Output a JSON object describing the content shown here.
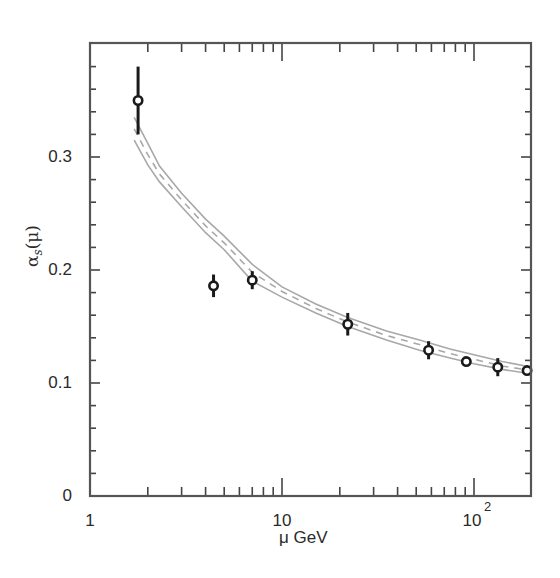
{
  "chart_data": {
    "type": "scatter",
    "title": "",
    "xlabel": "μ GeV",
    "ylabel": "αs(μ)",
    "ylabel_parts": {
      "symbol": "α",
      "subscript": "s",
      "arg": "(μ)"
    },
    "xscale": "log",
    "xlim": [
      1,
      200
    ],
    "ylim": [
      0,
      0.4
    ],
    "grid": false,
    "legend": null,
    "x_ticks": [
      {
        "value": 1,
        "label": "1"
      },
      {
        "value": 10,
        "label": "10"
      },
      {
        "value": 100,
        "label": "10",
        "superscript": "2"
      }
    ],
    "y_ticks": [
      {
        "value": 0,
        "label": "0"
      },
      {
        "value": 0.1,
        "label": "0.1"
      },
      {
        "value": 0.2,
        "label": "0.2"
      },
      {
        "value": 0.3,
        "label": "0.3"
      }
    ],
    "y_minor_step": 0.02,
    "series": [
      {
        "name": "measurements",
        "kind": "errorbar",
        "marker": "open-circle",
        "color": "#1a1a1a",
        "points": [
          {
            "x": 1.78,
            "y": 0.35,
            "err_lo": 0.03,
            "err_hi": 0.03
          },
          {
            "x": 4.4,
            "y": 0.186,
            "err_lo": 0.01,
            "err_hi": 0.01
          },
          {
            "x": 7.0,
            "y": 0.191,
            "err_lo": 0.008,
            "err_hi": 0.008
          },
          {
            "x": 22,
            "y": 0.152,
            "err_lo": 0.01,
            "err_hi": 0.01
          },
          {
            "x": 58,
            "y": 0.129,
            "err_lo": 0.008,
            "err_hi": 0.008
          },
          {
            "x": 91.2,
            "y": 0.119,
            "err_lo": 0.003,
            "err_hi": 0.003
          },
          {
            "x": 133,
            "y": 0.114,
            "err_lo": 0.008,
            "err_hi": 0.008
          },
          {
            "x": 189,
            "y": 0.111,
            "err_lo": 0.004,
            "err_hi": 0.004
          }
        ]
      },
      {
        "name": "QCD prediction (upper band)",
        "kind": "line",
        "style": "solid",
        "color": "#a8a8a8",
        "x": [
          1.7,
          2.0,
          2.3,
          3.0,
          4.0,
          5.0,
          7.0,
          10,
          15,
          22,
          35,
          52,
          75,
          100,
          140,
          200
        ],
        "y": [
          0.335,
          0.312,
          0.292,
          0.268,
          0.245,
          0.23,
          0.205,
          0.185,
          0.17,
          0.158,
          0.146,
          0.138,
          0.13,
          0.125,
          0.119,
          0.114
        ]
      },
      {
        "name": "QCD prediction (central)",
        "kind": "line",
        "style": "dashed",
        "color": "#a8a8a8",
        "x": [
          1.7,
          2.0,
          2.3,
          3.0,
          4.0,
          5.0,
          7.0,
          10,
          15,
          22,
          35,
          52,
          75,
          100,
          140,
          200
        ],
        "y": [
          0.325,
          0.302,
          0.285,
          0.262,
          0.239,
          0.224,
          0.198,
          0.181,
          0.166,
          0.154,
          0.142,
          0.134,
          0.126,
          0.121,
          0.115,
          0.111
        ]
      },
      {
        "name": "QCD prediction (lower band)",
        "kind": "line",
        "style": "solid",
        "color": "#a8a8a8",
        "x": [
          1.7,
          2.0,
          2.3,
          3.0,
          4.0,
          5.0,
          7.0,
          10,
          15,
          22,
          35,
          52,
          75,
          100,
          140,
          200
        ],
        "y": [
          0.315,
          0.293,
          0.278,
          0.256,
          0.233,
          0.218,
          0.19,
          0.176,
          0.162,
          0.15,
          0.138,
          0.129,
          0.122,
          0.117,
          0.112,
          0.108
        ]
      }
    ]
  },
  "layout": {
    "plot_left": 90,
    "plot_right": 531,
    "plot_top": 43,
    "plot_bottom": 496,
    "px_per_decade": 192,
    "px_per_unit_y": 1130
  }
}
